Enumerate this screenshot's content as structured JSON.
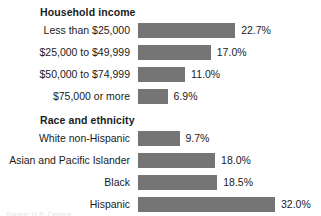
{
  "chart_data": {
    "type": "bar",
    "orientation": "horizontal",
    "title": "",
    "xlabel": "",
    "ylabel": "",
    "grid": false,
    "legend": false,
    "xlim": [
      0,
      32.0
    ],
    "value_suffix": "%",
    "bar_color": "#757575",
    "text_color": "#1b1b1b",
    "background": "#ffffff",
    "groups": [
      {
        "title": "Household income",
        "categories": [
          "Less than $25,000",
          "$25,000 to $49,999",
          "$50,000 to $74,999",
          "$75,000 or more"
        ],
        "values": [
          22.7,
          17.0,
          11.0,
          6.9
        ],
        "value_labels": [
          "22.7%",
          "17.0%",
          "11.0%",
          "6.9%"
        ]
      },
      {
        "title": "Race and ethnicity",
        "categories": [
          "White non-Hispanic",
          "Asian and Pacific Islander",
          "Black",
          "Hispanic"
        ],
        "values": [
          9.7,
          18.0,
          18.5,
          32.0
        ],
        "value_labels": [
          "9.7%",
          "18.0%",
          "18.5%",
          "32.0%"
        ]
      }
    ]
  },
  "sections": {
    "income": {
      "title": "Household income",
      "rows": [
        {
          "label": "Less than $25,000",
          "value": "22.7%",
          "pct": 22.7
        },
        {
          "label": "$25,000 to $49,999",
          "value": "17.0%",
          "pct": 17.0
        },
        {
          "label": "$50,000 to $74,999",
          "value": "11.0%",
          "pct": 11.0
        },
        {
          "label": "$75,000 or more",
          "value": "6.9%",
          "pct": 6.9
        }
      ]
    },
    "race": {
      "title": "Race and ethnicity",
      "rows": [
        {
          "label": "White non-Hispanic",
          "value": "9.7%",
          "pct": 9.7
        },
        {
          "label": "Asian and Pacific Islander",
          "value": "18.0%",
          "pct": 18.0
        },
        {
          "label": "Black",
          "value": "18.5%",
          "pct": 18.5
        },
        {
          "label": "Hispanic",
          "value": "32.0%",
          "pct": 32.0
        }
      ]
    }
  },
  "footnote": {
    "text": "Source: U.S. Census"
  }
}
